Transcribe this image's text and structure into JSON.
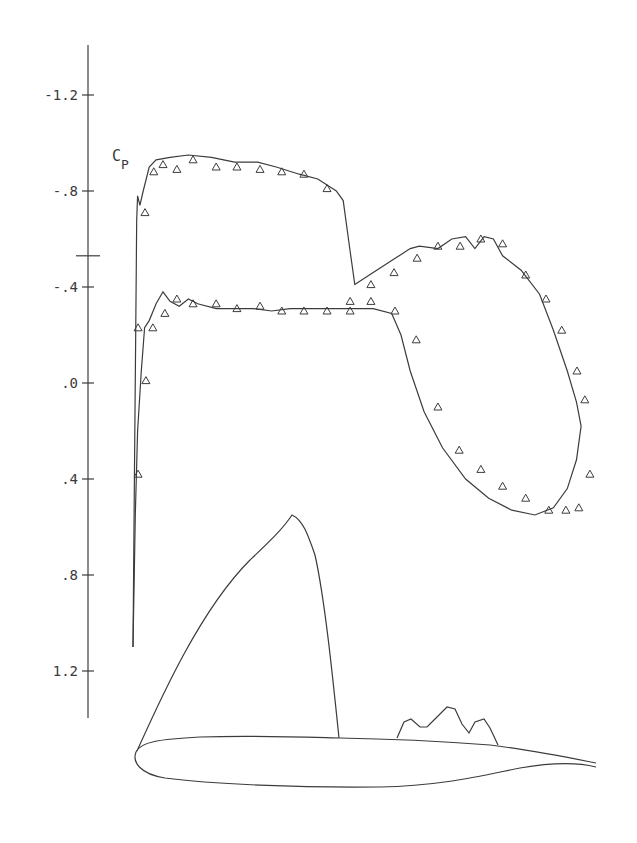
{
  "chart_data": {
    "type": "line",
    "title": "",
    "ylabel": "C_P",
    "ylabel_main": "C",
    "ylabel_sub": "P",
    "xlabel": "",
    "y_inverted": true,
    "ylim": [
      1.2,
      -1.2
    ],
    "y_ticks": [
      {
        "value": -1.2,
        "label": "-1.2"
      },
      {
        "value": -0.8,
        "label": "-.8"
      },
      {
        "value": -0.4,
        "label": "-.4"
      },
      {
        "value": 0.0,
        "label": ".0"
      },
      {
        "value": 0.4,
        "label": ".4"
      },
      {
        "value": 0.8,
        "label": ".8"
      },
      {
        "value": 1.2,
        "label": "1.2"
      }
    ],
    "critical_cp_marker": -0.53,
    "grid": false,
    "legend": null,
    "x_axis": "x/c (chord fraction, implicit)",
    "series": [
      {
        "name": "Upper surface (computed)",
        "kind": "line",
        "points": [
          [
            0.0,
            1.1
          ],
          [
            0.003,
            0.4
          ],
          [
            0.006,
            -0.25
          ],
          [
            0.008,
            -0.68
          ],
          [
            0.01,
            -0.78
          ],
          [
            0.015,
            -0.74
          ],
          [
            0.022,
            -0.8
          ],
          [
            0.035,
            -0.9
          ],
          [
            0.05,
            -0.93
          ],
          [
            0.08,
            -0.94
          ],
          [
            0.12,
            -0.95
          ],
          [
            0.17,
            -0.94
          ],
          [
            0.22,
            -0.92
          ],
          [
            0.27,
            -0.92
          ],
          [
            0.31,
            -0.9
          ],
          [
            0.36,
            -0.87
          ],
          [
            0.4,
            -0.85
          ],
          [
            0.44,
            -0.8
          ],
          [
            0.455,
            -0.76
          ],
          [
            0.47,
            -0.55
          ],
          [
            0.48,
            -0.41
          ],
          [
            0.52,
            -0.46
          ],
          [
            0.56,
            -0.51
          ],
          [
            0.6,
            -0.56
          ],
          [
            0.62,
            -0.57
          ],
          [
            0.66,
            -0.56
          ],
          [
            0.69,
            -0.6
          ],
          [
            0.72,
            -0.61
          ],
          [
            0.74,
            -0.56
          ],
          [
            0.76,
            -0.61
          ],
          [
            0.78,
            -0.6
          ],
          [
            0.8,
            -0.53
          ],
          [
            0.84,
            -0.47
          ],
          [
            0.88,
            -0.37
          ],
          [
            0.91,
            -0.22
          ],
          [
            0.94,
            -0.05
          ],
          [
            0.96,
            0.08
          ],
          [
            0.97,
            0.18
          ]
        ]
      },
      {
        "name": "Lower surface (computed)",
        "kind": "line",
        "points": [
          [
            0.0,
            1.1
          ],
          [
            0.005,
            0.55
          ],
          [
            0.01,
            0.2
          ],
          [
            0.018,
            -0.05
          ],
          [
            0.025,
            -0.23
          ],
          [
            0.035,
            -0.26
          ],
          [
            0.05,
            -0.33
          ],
          [
            0.065,
            -0.38
          ],
          [
            0.08,
            -0.34
          ],
          [
            0.1,
            -0.32
          ],
          [
            0.12,
            -0.35
          ],
          [
            0.14,
            -0.33
          ],
          [
            0.18,
            -0.31
          ],
          [
            0.22,
            -0.31
          ],
          [
            0.26,
            -0.31
          ],
          [
            0.3,
            -0.3
          ],
          [
            0.34,
            -0.31
          ],
          [
            0.4,
            -0.31
          ],
          [
            0.46,
            -0.31
          ],
          [
            0.52,
            -0.31
          ],
          [
            0.56,
            -0.29
          ],
          [
            0.58,
            -0.2
          ],
          [
            0.6,
            -0.05
          ],
          [
            0.63,
            0.12
          ],
          [
            0.67,
            0.27
          ],
          [
            0.72,
            0.4
          ],
          [
            0.77,
            0.48
          ],
          [
            0.82,
            0.53
          ],
          [
            0.87,
            0.55
          ],
          [
            0.91,
            0.52
          ],
          [
            0.94,
            0.44
          ],
          [
            0.96,
            0.32
          ],
          [
            0.97,
            0.18
          ]
        ]
      },
      {
        "name": "Upper surface (experiment)",
        "kind": "scatter",
        "marker": "triangle",
        "points": [
          [
            0.026,
            -0.71
          ],
          [
            0.045,
            -0.88
          ],
          [
            0.065,
            -0.91
          ],
          [
            0.095,
            -0.89
          ],
          [
            0.13,
            -0.93
          ],
          [
            0.18,
            -0.9
          ],
          [
            0.225,
            -0.9
          ],
          [
            0.275,
            -0.89
          ],
          [
            0.322,
            -0.88
          ],
          [
            0.37,
            -0.87
          ],
          [
            0.42,
            -0.81
          ],
          [
            0.515,
            -0.41
          ],
          [
            0.565,
            -0.46
          ],
          [
            0.615,
            -0.52
          ],
          [
            0.66,
            -0.57
          ],
          [
            0.708,
            -0.57
          ],
          [
            0.753,
            -0.6
          ],
          [
            0.8,
            -0.58
          ],
          [
            0.85,
            -0.45
          ],
          [
            0.894,
            -0.35
          ],
          [
            0.928,
            -0.22
          ],
          [
            0.961,
            -0.05
          ],
          [
            0.978,
            0.07
          ],
          [
            0.989,
            0.38
          ],
          [
            0.965,
            0.52
          ],
          [
            0.937,
            0.53
          ],
          [
            0.9,
            0.53
          ]
        ]
      },
      {
        "name": "Lower surface (experiment)",
        "kind": "scatter",
        "marker": "triangle",
        "points": [
          [
            0.011,
            0.38
          ],
          [
            0.028,
            -0.01
          ],
          [
            0.011,
            -0.23
          ],
          [
            0.043,
            -0.23
          ],
          [
            0.069,
            -0.29
          ],
          [
            0.095,
            -0.35
          ],
          [
            0.13,
            -0.33
          ],
          [
            0.18,
            -0.33
          ],
          [
            0.225,
            -0.31
          ],
          [
            0.275,
            -0.32
          ],
          [
            0.322,
            -0.3
          ],
          [
            0.37,
            -0.3
          ],
          [
            0.42,
            -0.3
          ],
          [
            0.47,
            -0.3
          ],
          [
            0.47,
            -0.34
          ],
          [
            0.515,
            -0.34
          ],
          [
            0.567,
            -0.3
          ],
          [
            0.613,
            -0.18
          ],
          [
            0.66,
            0.1
          ],
          [
            0.706,
            0.28
          ],
          [
            0.753,
            0.36
          ],
          [
            0.8,
            0.43
          ],
          [
            0.85,
            0.48
          ]
        ]
      }
    ],
    "annotations": [
      {
        "type": "airfoil_profile",
        "description": "Supercritical airfoil section drawn below the Cp plot"
      },
      {
        "type": "supersonic_region",
        "description": "Large sonic bubble over forward upper surface terminated by a shock near mid-chord"
      },
      {
        "type": "supersonic_region",
        "description": "Small secondary supersonic pockets on aft upper surface"
      }
    ]
  }
}
